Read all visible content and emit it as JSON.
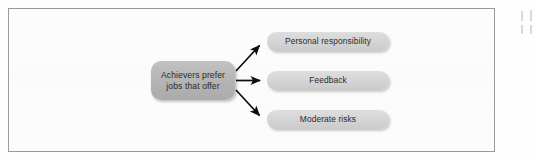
{
  "figure": {
    "type": "flow-diagram",
    "orientation": "left-to-right",
    "source_node": {
      "id": "source",
      "label": "Achievers prefer\njobs that offer",
      "fill": "#b4b4b4",
      "text_color": "#2b2b2b"
    },
    "outcome_nodes": [
      {
        "id": "personal-responsibility",
        "label": "Personal responsibility",
        "fill": "#d4d4d4",
        "text_color": "#2b2b2b"
      },
      {
        "id": "feedback",
        "label": "Feedback",
        "fill": "#d4d4d4",
        "text_color": "#2b2b2b"
      },
      {
        "id": "moderate-risks",
        "label": "Moderate risks",
        "fill": "#d4d4d4",
        "text_color": "#2b2b2b"
      }
    ],
    "connectors": [
      {
        "from": "source",
        "to": "personal-responsibility",
        "style": "solid-arrow",
        "color": "#0d0d0d"
      },
      {
        "from": "source",
        "to": "feedback",
        "style": "solid-arrow",
        "color": "#0d0d0d"
      },
      {
        "from": "source",
        "to": "moderate-risks",
        "style": "solid-arrow",
        "color": "#0d0d0d"
      }
    ],
    "frame": {
      "border_color": "#9a9a9a",
      "background": "#fdfdfd"
    }
  }
}
